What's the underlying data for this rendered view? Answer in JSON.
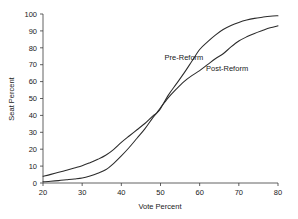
{
  "chart_data": {
    "type": "line",
    "title": "",
    "xlabel": "Vote Percent",
    "ylabel": "Seat Percent",
    "xlim": [
      20,
      80
    ],
    "ylim": [
      0,
      100
    ],
    "xticks": [
      20,
      30,
      40,
      50,
      60,
      70,
      80
    ],
    "yticks": [
      0,
      10,
      20,
      30,
      40,
      50,
      60,
      70,
      80,
      90,
      100
    ],
    "grid": false,
    "legend_position": "inline-annotations",
    "line_color": "#2b2b2b",
    "axis_color": "#3a3a3a",
    "background_color": "#ffffff",
    "x": [
      20,
      22,
      24,
      26,
      28,
      30,
      32,
      34,
      36,
      38,
      40,
      42,
      44,
      46,
      48,
      49,
      50,
      52,
      54,
      56,
      58,
      60,
      62,
      64,
      66,
      68,
      70,
      72,
      74,
      76,
      78,
      80
    ],
    "series": [
      {
        "name": "Pre-Reform",
        "label": "Pre-Reform",
        "label_x": 56,
        "label_y": 73,
        "values": [
          4.0,
          5.1,
          6.3,
          7.6,
          8.9,
          10.2,
          12.0,
          14.0,
          16.4,
          19.8,
          24.0,
          27.8,
          31.5,
          35.2,
          39.6,
          41.3,
          44.0,
          52.0,
          58.5,
          65.0,
          72.0,
          79.0,
          83.5,
          87.5,
          90.8,
          93.2,
          95.0,
          96.4,
          97.4,
          98.1,
          98.7,
          99.0
        ]
      },
      {
        "name": "Post-Reform",
        "label": "Post-Reform",
        "label_x": 67,
        "label_y": 66,
        "values": [
          0.7,
          1.0,
          1.4,
          1.9,
          2.4,
          3.0,
          4.2,
          5.8,
          7.8,
          11.5,
          16.0,
          21.0,
          26.5,
          32.0,
          38.5,
          41.3,
          44.5,
          50.5,
          55.5,
          60.0,
          63.5,
          66.5,
          70.0,
          73.5,
          76.5,
          80.5,
          84.0,
          86.5,
          88.5,
          90.2,
          91.8,
          93.0
        ]
      }
    ]
  },
  "axis": {
    "x_title": "Vote Percent",
    "y_title": "Seat Percent",
    "x_tick_labels": [
      "20",
      "30",
      "40",
      "50",
      "60",
      "70",
      "80"
    ],
    "y_tick_labels": [
      "0",
      "10",
      "20",
      "30",
      "40",
      "50",
      "60",
      "70",
      "80",
      "90",
      "100"
    ]
  }
}
